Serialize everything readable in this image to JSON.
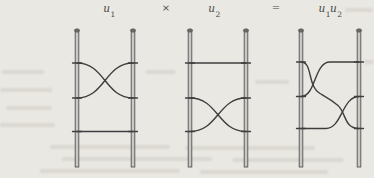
{
  "colors": {
    "background": "#eae8e3",
    "ink": "#3e3e3e",
    "post_fill": "#c9c8c4",
    "post_edge": "#525252",
    "post_cap": "#6e6e6e",
    "text": "#474747"
  },
  "expression": {
    "factor1": {
      "base": "u",
      "sub": "1"
    },
    "operator": "×",
    "factor2": {
      "base": "u",
      "sub": "2"
    },
    "equals": "=",
    "product": {
      "base1": "u",
      "sub1": "1",
      "base2": "u",
      "sub2": "2"
    }
  },
  "diagrams": [
    {
      "label": "u1",
      "posts": 2,
      "levels": 3,
      "features": [
        "crossing of two strands between level 1 and level 2",
        "straight rung at level 3"
      ]
    },
    {
      "label": "u2",
      "posts": 2,
      "levels": 3,
      "features": [
        "straight rung at level 1",
        "crossing of two strands between level 2 and level 3"
      ]
    },
    {
      "label": "u1u2",
      "posts": 2,
      "levels": 3,
      "features": [
        "crossing between level 1 and level 2 near left post",
        "crossing between level 2 and level 3 near right post",
        "top strand from right post level 1 into left crossing",
        "bottom strand from left post level 3 into right crossing",
        "connecting strand joining both crossings"
      ]
    }
  ]
}
